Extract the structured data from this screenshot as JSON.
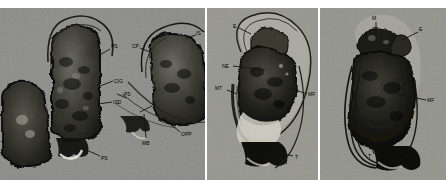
{
  "figure": {
    "kind": "electron-micrograph-plate",
    "panel_count": 3,
    "top_clipped_text": "· ·   · ·· ·  ·· ··· ·  ·· ·   ·· ·· ·",
    "background_hex": "#8e8e8b",
    "label_color_hex": "#14140f",
    "plate_background_hex": "#ffffff"
  },
  "panels": [
    {
      "id": "panel-1",
      "name": "left-micrograph",
      "labels": [
        {
          "key": "PS-top",
          "text": "PS"
        },
        {
          "key": "CIG",
          "text": "CIG"
        },
        {
          "key": "ISD",
          "text": "ISD"
        },
        {
          "key": "PS-bot",
          "text": "PS"
        },
        {
          "key": "PS-mid",
          "text": "PS"
        },
        {
          "key": "IS",
          "text": "IS"
        },
        {
          "key": "CP",
          "text": "CP"
        },
        {
          "key": "X",
          "text": "X"
        },
        {
          "key": "MB",
          "text": "MB"
        },
        {
          "key": "OPP",
          "text": "OPP"
        }
      ]
    },
    {
      "id": "panel-2",
      "name": "middle-micrograph",
      "labels": [
        {
          "key": "E",
          "text": "E"
        },
        {
          "key": "NE",
          "text": "NE"
        },
        {
          "key": "MT",
          "text": "MT"
        },
        {
          "key": "MF",
          "text": "MF"
        },
        {
          "key": "T",
          "text": "T"
        }
      ]
    },
    {
      "id": "panel-3",
      "name": "right-micrograph",
      "labels": [
        {
          "key": "M",
          "text": "M"
        },
        {
          "key": "E",
          "text": "E"
        },
        {
          "key": "MF",
          "text": "MF"
        },
        {
          "key": "T",
          "text": "T"
        }
      ]
    }
  ]
}
